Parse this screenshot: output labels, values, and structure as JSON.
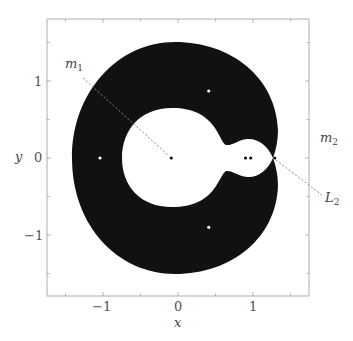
{
  "chart_data": {
    "type": "region",
    "title": "",
    "xlabel": "x",
    "ylabel": "y",
    "xlim": [
      -1.75,
      1.75
    ],
    "ylim": [
      -1.8,
      1.8
    ],
    "grid": false,
    "legend": null,
    "xticks": [
      -1,
      0,
      1
    ],
    "yticks": [
      1,
      0,
      -1
    ],
    "xtick_labels": [
      "−1",
      "0",
      "1"
    ],
    "ytick_labels": [
      "1",
      "0",
      "−1"
    ],
    "minor_tick_step": 0.5,
    "regions": [
      {
        "name": "forbidden-annulus",
        "fill": "#111111",
        "outer_extent": {
          "x": [
            -1.37,
            1.33
          ],
          "y": [
            -1.5,
            1.5
          ]
        }
      },
      {
        "name": "inner-allowed-region",
        "fill": "#ffffff",
        "main_circle_center": [
          -0.09,
          0.0
        ],
        "main_circle_radius": 0.65,
        "lobe_extent_x": [
          0.66,
          1.27
        ]
      }
    ],
    "points": [
      {
        "name": "L4",
        "x": 0.41,
        "y": 0.87,
        "color": "#ffffff"
      },
      {
        "name": "L5",
        "x": 0.41,
        "y": -0.9,
        "color": "#ffffff"
      },
      {
        "name": "L3",
        "x": -1.04,
        "y": 0.0,
        "color": "#ffffff"
      },
      {
        "name": "m1",
        "x": -0.09,
        "y": 0.0,
        "color": "#111111"
      },
      {
        "name": "L1",
        "x": 0.9,
        "y": 0.0,
        "color": "#111111"
      },
      {
        "name": "m2",
        "x": 0.97,
        "y": 0.0,
        "color": "#111111"
      },
      {
        "name": "L2",
        "x": 1.29,
        "y": 0.0,
        "color": "#111111"
      }
    ],
    "annotations": [
      {
        "text": "m1",
        "x_px": 72,
        "y_px": 64,
        "line_to": [
          -0.09,
          0.0
        ]
      },
      {
        "text": "m2",
        "x_px": 330,
        "y_px": 138
      },
      {
        "text": "L2",
        "x_px": 333,
        "y_px": 198,
        "line_to": [
          1.29,
          0.0
        ]
      }
    ]
  },
  "labels": {
    "x_axis": "x",
    "y_axis": "y",
    "xticks": [
      "−1",
      "0",
      "1"
    ],
    "yticks": [
      "1",
      "0",
      "−1"
    ],
    "m1": {
      "base": "m",
      "sub": "1"
    },
    "m2": {
      "base": "m",
      "sub": "2"
    },
    "L2": {
      "base": "L",
      "sub": "2"
    }
  }
}
